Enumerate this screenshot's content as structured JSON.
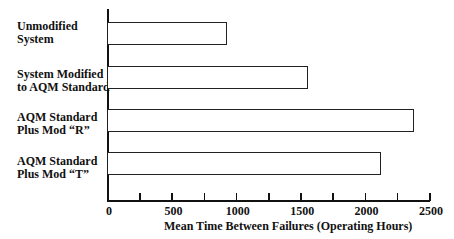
{
  "chart_data": {
    "type": "bar",
    "orientation": "horizontal",
    "title": "",
    "categories": [
      "Unmodified System",
      "System Modified to AQM Standard",
      "AQM Standard Plus Mod “R”",
      "AQM Standard Plus Mod “T”"
    ],
    "category_lines": [
      [
        "Unmodified",
        "System"
      ],
      [
        "System Modified",
        "to AQM Standard"
      ],
      [
        "AQM Standard",
        "Plus Mod “R”"
      ],
      [
        "AQM Standard",
        "Plus Mod “T”"
      ]
    ],
    "values": [
      930,
      1560,
      2380,
      2130
    ],
    "xlabel": "Mean Time Between Failures (Operating Hours)",
    "ylabel": "",
    "xlim": [
      0,
      2500
    ],
    "xticks": [
      "0",
      "500",
      "1000",
      "1500",
      "2000",
      "2500"
    ],
    "minor_tick_step": 250,
    "grid": false,
    "legend": null
  }
}
